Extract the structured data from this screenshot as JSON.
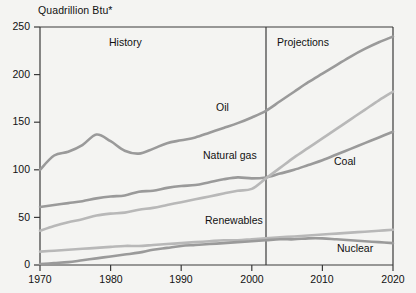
{
  "chart_data": {
    "type": "line",
    "title": "Quadrillion Btu*",
    "xlabel": "",
    "ylabel": "Quadrillion Btu*",
    "xlim": [
      1970,
      2020
    ],
    "ylim": [
      0,
      250
    ],
    "yticks": [
      0,
      50,
      100,
      150,
      200,
      250
    ],
    "xticks": [
      1970,
      1980,
      1990,
      2000,
      2010,
      2020
    ],
    "grid": false,
    "legend": "inline-annotations",
    "annotations": [
      {
        "text": "History",
        "x": 1986,
        "y": 238
      },
      {
        "text": "Projections",
        "x": 2008,
        "y": 238
      },
      {
        "text": "Oil",
        "x": 1995,
        "y": 160
      },
      {
        "text": "Natural gas",
        "x": 1993,
        "y": 110
      },
      {
        "text": "Coal",
        "x": 2013,
        "y": 107
      },
      {
        "text": "Renewables",
        "x": 1996,
        "y": 55
      },
      {
        "text": "Nuclear",
        "x": 2013,
        "y": 27
      }
    ],
    "divider": {
      "x": 2002,
      "label": "history-projections-divider"
    },
    "x": [
      1970,
      1972,
      1974,
      1976,
      1978,
      1980,
      1982,
      1984,
      1986,
      1988,
      1990,
      1992,
      1994,
      1996,
      1998,
      2000,
      2002,
      2004,
      2006,
      2008,
      2010,
      2012,
      2014,
      2016,
      2018,
      2020
    ],
    "series": [
      {
        "name": "Oil",
        "color": "#9a9a9a",
        "values": [
          100,
          115,
          119,
          126,
          137,
          130,
          120,
          117,
          122,
          128,
          131,
          134,
          139,
          144,
          149,
          155,
          162,
          172,
          182,
          192,
          201,
          210,
          219,
          227,
          234,
          240
        ]
      },
      {
        "name": "Coal",
        "color": "#9a9a9a",
        "values": [
          61,
          63,
          65,
          67,
          70,
          72,
          73,
          77,
          78,
          81,
          83,
          84,
          87,
          90,
          92,
          91,
          92,
          96,
          100,
          105,
          110,
          116,
          122,
          128,
          134,
          140
        ]
      },
      {
        "name": "Natural gas",
        "color": "#b8b8b8",
        "values": [
          36,
          41,
          45,
          48,
          52,
          54,
          55,
          58,
          60,
          63,
          66,
          69,
          72,
          75,
          78,
          80,
          91,
          102,
          113,
          123,
          133,
          143,
          153,
          163,
          173,
          182
        ]
      },
      {
        "name": "Renewables",
        "color": "#b8b8b8",
        "values": [
          14,
          15,
          16,
          17,
          18,
          19,
          20,
          20,
          21,
          22,
          23,
          24,
          25,
          26,
          26,
          27,
          28,
          29,
          30,
          31,
          32,
          33,
          34,
          35,
          36,
          37
        ]
      },
      {
        "name": "Nuclear",
        "color": "#9a9a9a",
        "values": [
          1,
          2,
          3,
          5,
          7,
          9,
          11,
          13,
          16,
          18,
          20,
          21,
          22,
          23,
          24,
          25,
          26,
          27,
          27,
          28,
          28,
          27,
          26,
          25,
          24,
          23
        ]
      }
    ]
  },
  "axis": {
    "title": "Quadrillion Btu*",
    "y_ticks": [
      "250",
      "200",
      "150",
      "100",
      "50",
      "0"
    ],
    "x_ticks": [
      "1970",
      "1980",
      "1990",
      "2000",
      "2010",
      "2020"
    ]
  },
  "labels": {
    "history": "History",
    "projections": "Projections",
    "oil": "Oil",
    "natural_gas": "Natural gas",
    "coal": "Coal",
    "renewables": "Renewables",
    "nuclear": "Nuclear"
  },
  "colors": {
    "background": "#f4f4f2",
    "axis": "#3a3a3a",
    "series_dark": "#9a9a9a",
    "series_light": "#b8b8b8",
    "text": "#111111"
  }
}
